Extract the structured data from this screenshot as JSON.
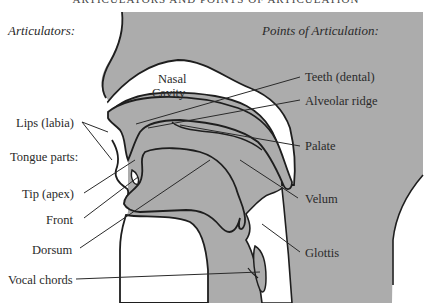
{
  "title": "ARTICULATORS AND POINTS OF ARTICULATION",
  "headers": {
    "articulators": "Articulators:",
    "points": "Points of Articulation:"
  },
  "cavity": {
    "line1": "Nasal",
    "line2": "Cavity"
  },
  "articulators": {
    "lips": "Lips (labia)",
    "tongue_parts": "Tongue parts:",
    "tip": "Tip (apex)",
    "front": "Front",
    "dorsum": "Dorsum",
    "vocal_chords": "Vocal chords"
  },
  "points": {
    "teeth": "Teeth (dental)",
    "alveolar": "Alveolar ridge",
    "palate": "Palate",
    "velum": "Velum",
    "glottis": "Glottis"
  },
  "colors": {
    "tissue": "#acacac",
    "outline": "#1e1e1e",
    "background": "#ffffff"
  }
}
